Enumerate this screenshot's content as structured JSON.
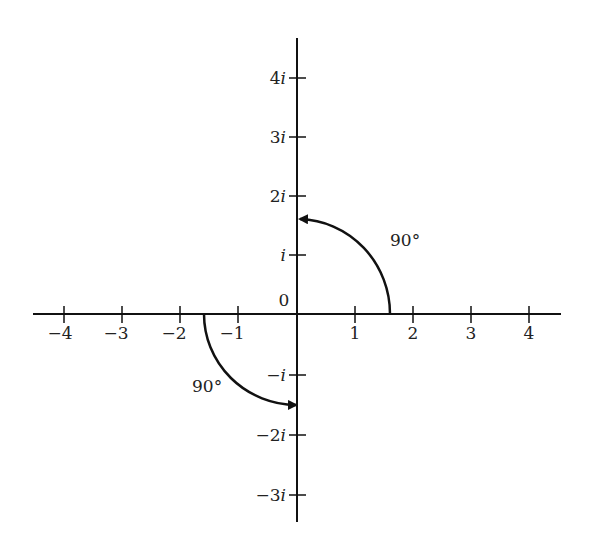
{
  "diagram": {
    "origin_label": "0",
    "x_ticks": [
      {
        "value": -4,
        "label": "−4"
      },
      {
        "value": -3,
        "label": "−3"
      },
      {
        "value": -2,
        "label": "−2"
      },
      {
        "value": -1,
        "label": "−1"
      },
      {
        "value": 1,
        "label": "1"
      },
      {
        "value": 2,
        "label": "2"
      },
      {
        "value": 3,
        "label": "3"
      },
      {
        "value": 4,
        "label": "4"
      }
    ],
    "y_ticks": [
      {
        "value": 4,
        "num": "4",
        "unit": "i"
      },
      {
        "value": 3,
        "num": "3",
        "unit": "i"
      },
      {
        "value": 2,
        "num": "2",
        "unit": "i"
      },
      {
        "value": 1,
        "num": "",
        "unit": "i"
      },
      {
        "value": -1,
        "num": "−",
        "unit": "i"
      },
      {
        "value": -2,
        "num": "−2",
        "unit": "i"
      },
      {
        "value": -3,
        "num": "−3",
        "unit": "i"
      }
    ],
    "arcs": [
      {
        "from": "1.6",
        "to": "1.6i",
        "label": "90°"
      },
      {
        "from": "-1.6",
        "to": "-1.6i",
        "label": "90°"
      }
    ]
  }
}
